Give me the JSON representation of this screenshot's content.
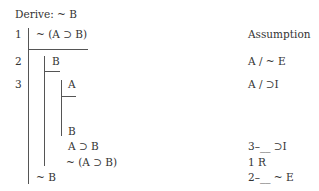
{
  "header": {
    "derive_label": "Derive: ~ B"
  },
  "proof": {
    "lines": [
      {
        "num": "1",
        "formula": "~ (A ⊃ B)",
        "justification": "Assumption"
      },
      {
        "num": "2",
        "formula": "B",
        "justification": "A / ~ E"
      },
      {
        "num": "3",
        "formula": "A",
        "justification": "A / ⊃I"
      },
      {
        "num": "",
        "formula": "B",
        "justification": ""
      },
      {
        "num": "",
        "formula": "A ⊃ B",
        "justification": "3–__ ⊃I"
      },
      {
        "num": "",
        "formula": "~ (A ⊃ B)",
        "justification": "1 R"
      },
      {
        "num": "",
        "formula": "~ B",
        "justification": "2–__ ~ E"
      }
    ]
  }
}
